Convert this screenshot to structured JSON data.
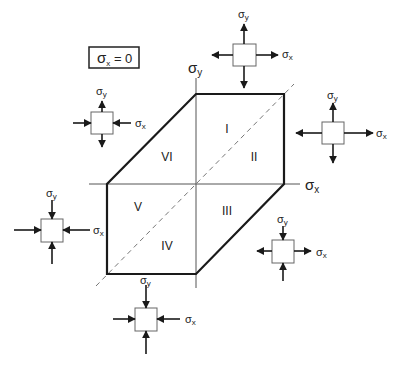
{
  "condition_box": {
    "sigma": "σ",
    "sub": "x",
    "rest": " = 0"
  },
  "axes": {
    "x_label": {
      "sigma": "σ",
      "sub": "x"
    },
    "y_label": {
      "sigma": "σ",
      "sub": "y"
    }
  },
  "regions": [
    {
      "id": "I",
      "label": "I"
    },
    {
      "id": "II",
      "label": "II"
    },
    {
      "id": "III",
      "label": "III"
    },
    {
      "id": "IV",
      "label": "IV"
    },
    {
      "id": "V",
      "label": "V"
    },
    {
      "id": "VI",
      "label": "VI"
    }
  ],
  "elements": [
    {
      "region": "I",
      "sigma_x": "tension",
      "sigma_y": "tension"
    },
    {
      "region": "II",
      "sigma_x": "tension",
      "sigma_y": "tension"
    },
    {
      "region": "III",
      "sigma_x": "tension",
      "sigma_y": "compression"
    },
    {
      "region": "IV",
      "sigma_x": "compression",
      "sigma_y": "compression"
    },
    {
      "region": "V",
      "sigma_x": "compression",
      "sigma_y": "compression"
    },
    {
      "region": "VI",
      "sigma_x": "compression",
      "sigma_y": "tension"
    }
  ],
  "element_labels": {
    "sigma": "σ",
    "x": "x",
    "y": "y"
  },
  "colors": {
    "line": "#1a1a1a",
    "axis": "#555555",
    "dash": "#777777",
    "box": "#666666"
  }
}
